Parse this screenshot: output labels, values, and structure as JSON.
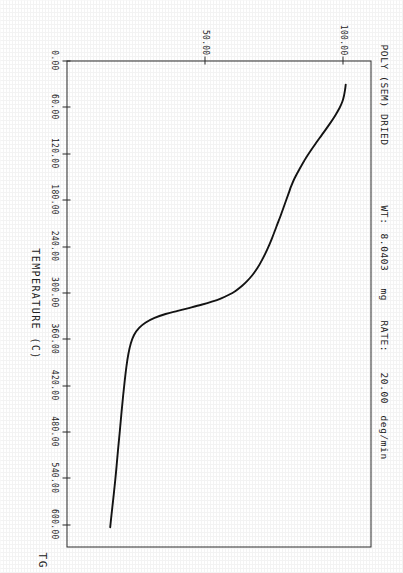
{
  "header": {
    "sample_name": "POLY (SEM) DRIED",
    "weight_label": "WT:",
    "weight_value": "8.0403",
    "weight_unit": "mg",
    "rate_label": "RATE:",
    "rate_value": "20.00",
    "rate_unit": "deg/min"
  },
  "corner_label": "TG",
  "chart_data": {
    "type": "line",
    "title": "POLY (SEM) DRIED",
    "xlabel": "TEMPERATURE (C)",
    "ylabel": "% WEIGHT",
    "xlim": [
      0,
      630
    ],
    "ylim": [
      0,
      110
    ],
    "grid": false,
    "legend": null,
    "x_ticks": [
      0,
      60,
      120,
      180,
      240,
      300,
      360,
      420,
      480,
      540,
      600
    ],
    "x_tick_labels": [
      "0.00",
      "60.00",
      "120.00",
      "180.00",
      "240.00",
      "300.00",
      "360.00",
      "420.00",
      "480.00",
      "540.00",
      "600.00"
    ],
    "y_ticks": [
      50,
      100
    ],
    "y_tick_labels": [
      "50.00",
      "100.00"
    ],
    "series": [
      {
        "name": "TG",
        "color": "#141414",
        "x": [
          30,
          36,
          44,
          52,
          60,
          70,
          82,
          95,
          110,
          125,
          140,
          152,
          162,
          170,
          178,
          188,
          200,
          215,
          230,
          245,
          258,
          268,
          278,
          286,
          292,
          298,
          303,
          308,
          312,
          316,
          320,
          324,
          328,
          333,
          339,
          346,
          355,
          366,
          380,
          396,
          414,
          434,
          456,
          480,
          506,
          534,
          562,
          588,
          605
        ],
        "y": [
          101.0,
          100.8,
          100.4,
          99.8,
          98.8,
          97.2,
          95.0,
          92.4,
          89.4,
          86.6,
          84.2,
          82.4,
          81.2,
          80.4,
          79.6,
          78.6,
          77.4,
          75.8,
          74.2,
          72.4,
          70.6,
          69.0,
          67.0,
          65.0,
          63.2,
          61.0,
          58.6,
          55.6,
          52.4,
          48.6,
          44.4,
          40.0,
          35.6,
          31.6,
          28.4,
          26.0,
          24.2,
          23.0,
          22.1,
          21.4,
          20.8,
          20.2,
          19.6,
          19.0,
          18.3,
          17.6,
          16.8,
          16.0,
          15.5
        ]
      }
    ],
    "annotations": [
      {
        "text": "WT: 8.0403 mg",
        "position": "top-left"
      },
      {
        "text": "RATE: 20.00 deg/min",
        "position": "top-left"
      },
      {
        "text": "TG",
        "position": "bottom-right"
      }
    ]
  }
}
